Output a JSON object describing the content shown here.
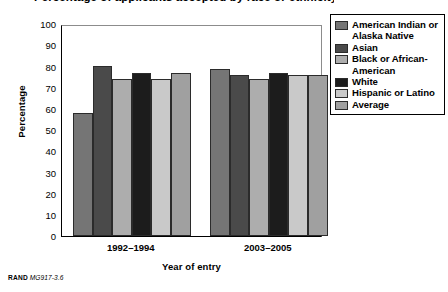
{
  "title_partial": "Percentage of applicants accepted by race or ethnicity",
  "footer": {
    "org": "RAND",
    "figure_id": "MG917-3.6"
  },
  "axes": {
    "ylabel": "Percentage",
    "xlabel": "Year of entry",
    "yticks": [
      "100",
      "90",
      "80",
      "70",
      "60",
      "50",
      "40",
      "30",
      "20",
      "10",
      "0"
    ]
  },
  "legend": {
    "items": [
      {
        "label": "American Indian or Alaska Native",
        "color": "#757575"
      },
      {
        "label": "Asian",
        "color": "#4a4a4a"
      },
      {
        "label": "Black or African-American",
        "color": "#adadad"
      },
      {
        "label": "White",
        "color": "#1c1c1c"
      },
      {
        "label": "Hispanic or Latino",
        "color": "#c9c9c9"
      },
      {
        "label": "Average",
        "color": "#a0a0a0"
      }
    ]
  },
  "chart_data": {
    "type": "bar",
    "title": "Percentage of applicants accepted by race or ethnicity",
    "xlabel": "Year of entry",
    "ylabel": "Percentage",
    "ylim": [
      0,
      100
    ],
    "ytick_step": 10,
    "grid": false,
    "legend_position": "right",
    "categories": [
      "1992–1994",
      "2003–2005"
    ],
    "series": [
      {
        "name": "American Indian or Alaska Native",
        "color": "#757575",
        "values": [
          58,
          79
        ]
      },
      {
        "name": "Asian",
        "color": "#4a4a4a",
        "values": [
          80,
          76
        ]
      },
      {
        "name": "Black or African-American",
        "color": "#adadad",
        "values": [
          74,
          74
        ]
      },
      {
        "name": "White",
        "color": "#1c1c1c",
        "values": [
          77,
          77
        ]
      },
      {
        "name": "Hispanic or Latino",
        "color": "#c9c9c9",
        "values": [
          74,
          76
        ]
      },
      {
        "name": "Average",
        "color": "#a0a0a0",
        "values": [
          77,
          76
        ]
      }
    ]
  }
}
